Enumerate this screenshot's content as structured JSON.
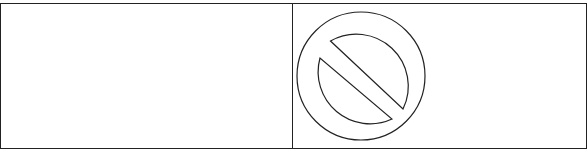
{
  "diagram": {
    "panels": [
      {
        "id": "left",
        "content": ""
      },
      {
        "id": "right",
        "icon": "prohibition-icon"
      }
    ],
    "colors": {
      "stroke": "#222222",
      "background": "#ffffff"
    }
  }
}
